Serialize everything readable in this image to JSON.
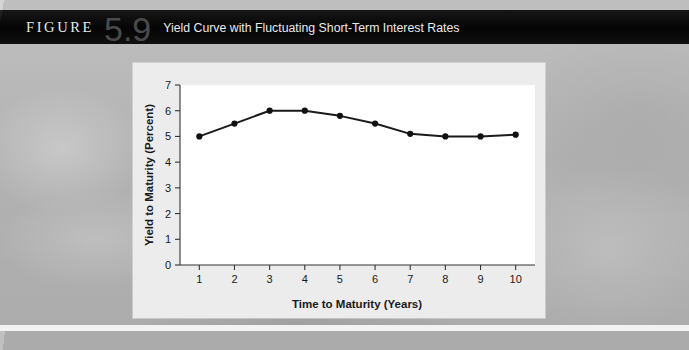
{
  "figure": {
    "label": "FIGURE",
    "number": "5.9",
    "title": "Yield Curve with Fluctuating Short-Term Interest Rates"
  },
  "colors": {
    "titlebar_bg": "#0a0a0a",
    "title_text": "#eaeaea",
    "figure_number": "#4a4a4a",
    "panel_bg": "#ececec",
    "plot_bg": "#ffffff",
    "line": "#1a1a1a",
    "marker": "#111111",
    "axis": "#333333",
    "page_bg": "#b8b8b8",
    "divider": "#f2f2f2"
  },
  "chart_data": {
    "type": "line",
    "title": "",
    "xlabel": "Time to Maturity (Years)",
    "ylabel": "Yield to Maturity (Percent)",
    "x": [
      1,
      2,
      3,
      4,
      5,
      6,
      7,
      8,
      9,
      10
    ],
    "values": [
      5.0,
      5.5,
      6.0,
      6.0,
      5.8,
      5.5,
      5.1,
      5.0,
      5.0,
      5.07
    ],
    "xticklabels": [
      "1",
      "2",
      "3",
      "4",
      "5",
      "6",
      "7",
      "8",
      "9",
      "10"
    ],
    "yticklabels": [
      "0",
      "1",
      "2",
      "3",
      "4",
      "5",
      "6",
      "7"
    ],
    "yticks": [
      0,
      1,
      2,
      3,
      4,
      5,
      6,
      7
    ],
    "xlim": [
      0.45,
      10.55
    ],
    "ylim": [
      0,
      7
    ],
    "grid": false,
    "legend": null,
    "marker": "filled-circle",
    "series": [
      {
        "name": "Yield curve",
        "values": [
          5.0,
          5.5,
          6.0,
          6.0,
          5.8,
          5.5,
          5.1,
          5.0,
          5.0,
          5.07
        ]
      }
    ]
  }
}
